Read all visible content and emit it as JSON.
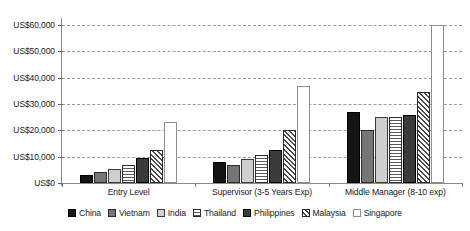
{
  "chart_data": {
    "type": "bar",
    "title": "",
    "xlabel": "",
    "ylabel": "",
    "ylim": [
      0,
      60000
    ],
    "ytick_labels": [
      "US$60,000",
      "US$50,000",
      "US$40,000",
      "US$30,000",
      "US$20,000",
      "US$10,000",
      "US$0"
    ],
    "ytick_values": [
      60000,
      50000,
      40000,
      30000,
      20000,
      10000,
      0
    ],
    "grid": true,
    "legend_position": "bottom",
    "categories": [
      "Entry Level",
      "Supervisor (3-5 Years Exp)",
      "Middle Manager (8-10 exp)"
    ],
    "series": [
      {
        "name": "China",
        "values": [
          3000,
          8000,
          27000
        ],
        "fill": "solid-black"
      },
      {
        "name": "Vietnam",
        "values": [
          4000,
          7000,
          20000
        ],
        "fill": "solid-mid-gray"
      },
      {
        "name": "India",
        "values": [
          5500,
          9000,
          25000
        ],
        "fill": "solid-light-gray"
      },
      {
        "name": "Thailand",
        "values": [
          7000,
          10500,
          25000
        ],
        "fill": "horizontal-lines"
      },
      {
        "name": "Philippines",
        "values": [
          9500,
          12500,
          26000
        ],
        "fill": "solid-dark-gray"
      },
      {
        "name": "Malaysia",
        "values": [
          12500,
          20000,
          34500
        ],
        "fill": "diagonal-hatch"
      },
      {
        "name": "Singapore",
        "values": [
          23000,
          37000,
          60000
        ],
        "fill": "white-outline"
      }
    ]
  },
  "colors": {
    "china": "#141414",
    "vietnam": "#767676",
    "india": "#cfcfcf",
    "thailand": "#ffffff",
    "philippines": "#3b3b3b",
    "malaysia": "#ffffff",
    "singapore": "#ffffff",
    "axis": "#8a8a8a",
    "gridline": "#9a9a9a",
    "background": "#ffffff"
  }
}
